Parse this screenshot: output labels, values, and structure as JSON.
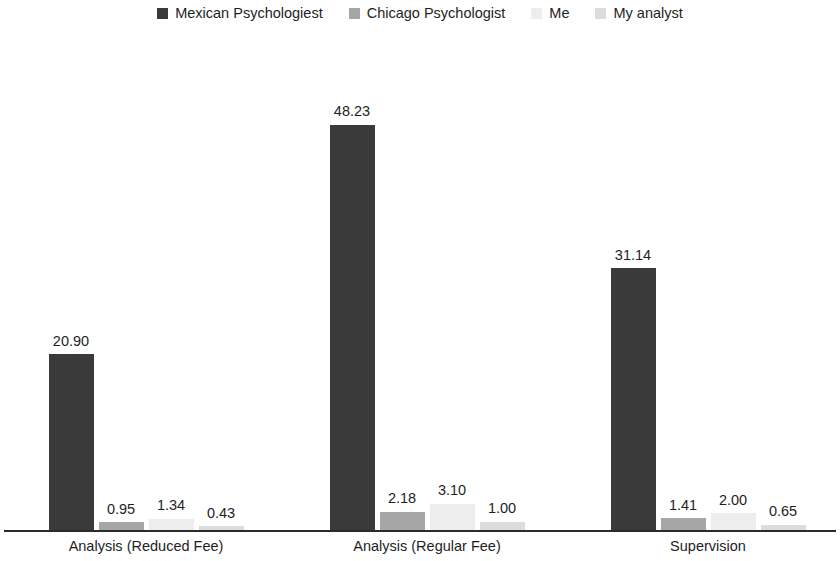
{
  "chart_data": {
    "type": "bar",
    "title": "",
    "subtitle": "",
    "xlabel": "",
    "ylabel": "",
    "grid": false,
    "legend_position": "top-center",
    "axis_visible": {
      "x": true,
      "y": false
    },
    "value_labels": true,
    "value_label_format": "0.00",
    "ylim": [
      0,
      48.23
    ],
    "categories": [
      "Analysis (Reduced Fee)",
      "Analysis (Regular Fee)",
      "Supervision"
    ],
    "series": [
      {
        "name": "Mexican Psychologiest",
        "color": "#3a3a3a",
        "values": [
          20.9,
          48.23,
          31.14
        ],
        "labels": [
          "20.90",
          "48.23",
          "31.14"
        ]
      },
      {
        "name": "Chicago Psychologist",
        "color": "#a6a6a6",
        "values": [
          0.95,
          2.18,
          1.41
        ],
        "labels": [
          "0.95",
          "2.18",
          "1.41"
        ]
      },
      {
        "name": "Me",
        "color": "#ededed",
        "values": [
          1.34,
          3.1,
          2.0
        ],
        "labels": [
          "1.34",
          "3.10",
          "2.00"
        ]
      },
      {
        "name": "My analyst",
        "color": "#dcdcdc",
        "values": [
          0.43,
          1.0,
          0.65
        ],
        "labels": [
          "0.43",
          "1.00",
          "0.65"
        ]
      }
    ]
  },
  "legend": {
    "items": [
      {
        "label": "Mexican Psychologiest",
        "color": "#3a3a3a"
      },
      {
        "label": "Chicago Psychologist",
        "color": "#a6a6a6"
      },
      {
        "label": "Me",
        "color": "#ededed"
      },
      {
        "label": "My analyst",
        "color": "#dcdcdc"
      }
    ]
  },
  "axis": {
    "line_color": "#2b2b2b",
    "category_labels": [
      "Analysis (Reduced Fee)",
      "Analysis (Regular Fee)",
      "Supervision"
    ]
  },
  "layout": {
    "baseline_y": 530,
    "pixels_per_unit": 8.4,
    "bar_width": 45,
    "bar_gap": 5,
    "group_centers": [
      146,
      427,
      708
    ]
  }
}
